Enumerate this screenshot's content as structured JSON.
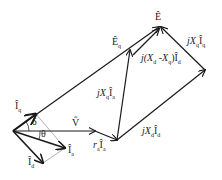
{
  "diagram": {
    "type": "phasor-diagram",
    "colors": {
      "line": "#1a1a1a",
      "guide": "#9a9a9a",
      "background": "#ffffff"
    },
    "labels": {
      "E": "Ê",
      "Eq": "Ê",
      "Eq_sub": "q",
      "Iq": "Î",
      "Iq_sub": "q",
      "Ia": "Î",
      "Ia_sub": "a",
      "Id": "Î",
      "Id_sub": "d",
      "V": "V̂",
      "delta": "δ",
      "theta": "θ",
      "ra_Ia_r": "r",
      "ra_Ia_rsub": "a",
      "ra_Ia_I": "Î",
      "ra_Ia_Isub": "a",
      "jXq_Ia_j": "jX",
      "jXq_Ia_Xsub": "q",
      "jXq_Ia_I": "Î",
      "jXq_Ia_Isub": "a",
      "jXd_Id_j": "jX",
      "jXd_Id_Xsub": "d",
      "jXd_Id_I": "Î",
      "jXd_Id_Isub": "d",
      "jXq_Iq_j": "jX",
      "jXq_Iq_Xsub": "q",
      "jXq_Iq_I": "Î",
      "jXq_Iq_Isub": "q",
      "jXdXq_Id_a": "j(X",
      "jXdXq_Id_s1": "d",
      "jXdXq_Id_b": " -X",
      "jXdXq_Id_s2": "q",
      "jXdXq_Id_c": ")Î",
      "jXdXq_Id_s3": "d"
    }
  }
}
